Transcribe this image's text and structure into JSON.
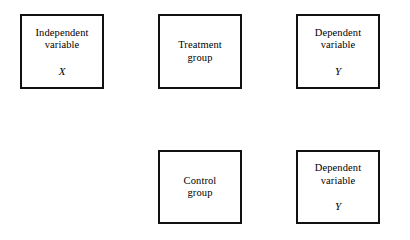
{
  "diagram": {
    "type": "flowchart-boxes",
    "canvas": {
      "width": 410,
      "height": 240,
      "background": "#ffffff"
    },
    "style": {
      "box_fill": "#ffffff",
      "box_border_color": "#111111",
      "shadow_color": "#595959",
      "text_color": "#000000"
    },
    "nodes": [
      {
        "id": "independent-variable",
        "label": "Independent\nvariable",
        "variable": "X",
        "row": "top",
        "column": 1
      },
      {
        "id": "treatment-group",
        "label": "Treatment\ngroup",
        "variable": "",
        "row": "top",
        "column": 2
      },
      {
        "id": "dependent-variable-treatment",
        "label": "Dependent\nvariable",
        "variable": "Y",
        "row": "top",
        "column": 3
      },
      {
        "id": "control-group",
        "label": "Control\ngroup",
        "variable": "",
        "row": "bottom",
        "column": 2
      },
      {
        "id": "dependent-variable-control",
        "label": "Dependent\nvariable",
        "variable": "Y",
        "row": "bottom",
        "column": 3
      }
    ]
  }
}
